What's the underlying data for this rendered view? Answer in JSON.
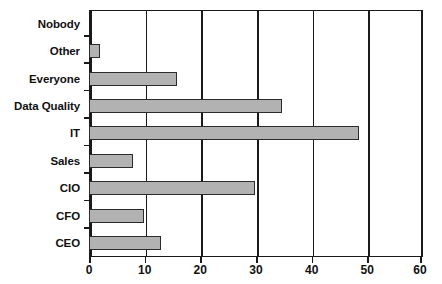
{
  "chart_data": {
    "type": "bar",
    "orientation": "horizontal",
    "title": "",
    "subtitle": "",
    "xlabel": "",
    "ylabel": "",
    "categories": [
      "Nobody",
      "Other",
      "Everyone",
      "Data Quality",
      "IT",
      "Sales",
      "CIO",
      "CFO",
      "CEO"
    ],
    "values": [
      0,
      2,
      16,
      35,
      49,
      8,
      30,
      10,
      13
    ],
    "xlim": [
      0,
      60
    ],
    "xticks": [
      0,
      10,
      20,
      30,
      40,
      50,
      60
    ],
    "xtick_labels": [
      "0",
      "10",
      "20",
      "30",
      "40",
      "50",
      "60"
    ],
    "grid": "vertical",
    "legend": "none",
    "bar_fill_color": "#b2b2b2",
    "bar_border_color": "#2b2b2b",
    "axis_color": "#1a1a1a",
    "background_color": "#ffffff"
  }
}
